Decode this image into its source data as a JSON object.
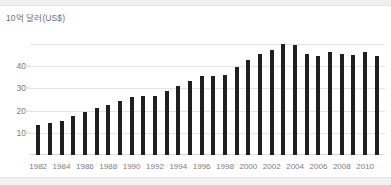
{
  "chart_data": {
    "type": "bar",
    "title": "",
    "subtitle": "",
    "xlabel": "",
    "ylabel": "10억 달러(US$)",
    "ylim": [
      0,
      55
    ],
    "xlim": [
      1981.3,
      2011.7
    ],
    "grid": true,
    "legend": null,
    "bar_color": "#1f1f1f",
    "grid_color": "#e4e4e4",
    "y_ticks": [
      10,
      20,
      30,
      40
    ],
    "y_tick_labels": [
      "10",
      "20",
      "30",
      "40"
    ],
    "x_tick_labels": [
      "1982",
      "1984",
      "1986",
      "1988",
      "1990",
      "1992",
      "1994",
      "1996",
      "1998",
      "2000",
      "2002",
      "2004",
      "2006",
      "2008",
      "2010"
    ],
    "categories": [
      "1982",
      "1983",
      "1984",
      "1985",
      "1986",
      "1987",
      "1988",
      "1989",
      "1990",
      "1991",
      "1992",
      "1993",
      "1994",
      "1995",
      "1996",
      "1997",
      "1998",
      "1999",
      "2000",
      "2001",
      "2002",
      "2003",
      "2004",
      "2005",
      "2006",
      "2007",
      "2008",
      "2009",
      "2010",
      "2011"
    ],
    "values": [
      13.5,
      14.5,
      15.5,
      17.5,
      19.5,
      21.0,
      22.5,
      24.5,
      26.0,
      26.5,
      26.5,
      29.0,
      31.0,
      33.5,
      35.5,
      35.5,
      36.0,
      39.5,
      43.0,
      45.5,
      47.5,
      50.0,
      49.5,
      45.5,
      44.5,
      46.5,
      45.5,
      45.0,
      46.5,
      44.5
    ]
  }
}
